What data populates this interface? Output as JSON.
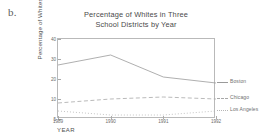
{
  "part_label": "b.",
  "chart_data": {
    "type": "line",
    "title": "Percentage of Whites in Three School Districts by Year",
    "title_lines": [
      "Percentage of Whites in Three",
      "School Districts by Year"
    ],
    "xlabel": "YEAR",
    "ylabel": "Percentage of Whites",
    "grid": false,
    "legend_position": "right-outside",
    "x": [
      1989,
      1990,
      1991,
      1992
    ],
    "xtick_labels": [
      "1989",
      "1990",
      "1991",
      "1992"
    ],
    "ytick_labels": [
      "40",
      "30",
      "20",
      "10",
      "5"
    ],
    "ytick_values": [
      40,
      30,
      20,
      10,
      5
    ],
    "ylim": [
      5,
      40
    ],
    "series": [
      {
        "name": "Boston",
        "style": "solid",
        "color": "#9a9a9a",
        "values": [
          27,
          32,
          21,
          18
        ]
      },
      {
        "name": "Chicago",
        "style": "dashed",
        "color": "#a8a8a8",
        "values": [
          9,
          10,
          11,
          10
        ]
      },
      {
        "name": "Los Angeles",
        "style": "dotted",
        "color": "#b5b5b5",
        "values": [
          7,
          6,
          6,
          7
        ]
      }
    ]
  }
}
